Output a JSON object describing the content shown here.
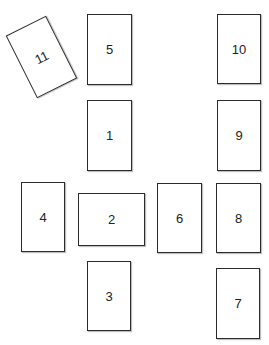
{
  "diagram": {
    "type": "card-spread-layout",
    "cards": [
      {
        "label": "1",
        "x": 87,
        "y": 100,
        "w": 45,
        "h": 71,
        "rotate": 0
      },
      {
        "label": "2",
        "x": 78,
        "y": 193,
        "w": 67,
        "h": 53,
        "rotate": 0
      },
      {
        "label": "3",
        "x": 87,
        "y": 261,
        "w": 44,
        "h": 70,
        "rotate": 0
      },
      {
        "label": "4",
        "x": 21,
        "y": 182,
        "w": 44,
        "h": 70,
        "rotate": 0
      },
      {
        "label": "5",
        "x": 87,
        "y": 14,
        "w": 45,
        "h": 71,
        "rotate": 0
      },
      {
        "label": "6",
        "x": 157,
        "y": 183,
        "w": 45,
        "h": 70,
        "rotate": 0
      },
      {
        "label": "7",
        "x": 216,
        "y": 268,
        "w": 44,
        "h": 71,
        "rotate": 0
      },
      {
        "label": "8",
        "x": 216,
        "y": 183,
        "w": 45,
        "h": 70,
        "rotate": 0
      },
      {
        "label": "9",
        "x": 217,
        "y": 100,
        "w": 44,
        "h": 71,
        "rotate": 0
      },
      {
        "label": "10",
        "x": 217,
        "y": 14,
        "w": 44,
        "h": 70,
        "rotate": 0
      },
      {
        "label": "11",
        "x": 19,
        "y": 22,
        "w": 45,
        "h": 70,
        "rotate": -26.6
      }
    ]
  }
}
